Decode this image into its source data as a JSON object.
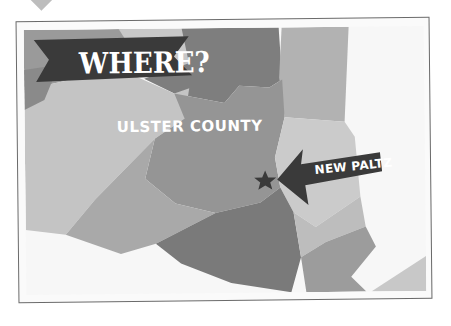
{
  "banner": {
    "title": "WHERE?"
  },
  "map": {
    "region_label": "ULSTER COUNTY",
    "marker": {
      "label": "NEW PALTZ",
      "icon": "star-icon"
    },
    "colors": {
      "banner": "#3a3a3a",
      "region_dark": "#7c7c7c",
      "region_mid": "#9a9a9a",
      "region_light": "#b8b8b8",
      "region_lighter": "#cfcfcf",
      "background": "#f7f7f7",
      "frame": "#6a6a6a"
    }
  }
}
